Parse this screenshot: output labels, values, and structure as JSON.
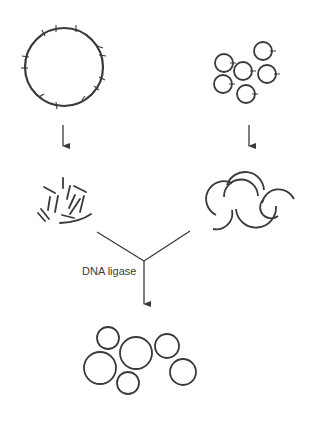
{
  "diagram": {
    "type": "process-flow",
    "stroke_color": "#3a3a3a",
    "labels": {
      "ligase_step": "DNA ligase"
    },
    "nodes": [
      {
        "id": "large-circular-dna",
        "shape": "circle-with-cut-sites",
        "count": 1
      },
      {
        "id": "small-plasmids",
        "shape": "small-circles-with-cut-site",
        "count": 6
      },
      {
        "id": "dna-fragments",
        "shape": "short-linear-fragments"
      },
      {
        "id": "opened-plasmids",
        "shape": "open-arcs",
        "count": 5
      },
      {
        "id": "recombinant-plasmids",
        "shape": "closed-circles",
        "count": 6
      }
    ],
    "edges": [
      {
        "from": "large-circular-dna",
        "to": "dna-fragments"
      },
      {
        "from": "small-plasmids",
        "to": "opened-plasmids"
      },
      {
        "from": "dna-fragments",
        "to": "recombinant-plasmids",
        "label": "DNA ligase"
      },
      {
        "from": "opened-plasmids",
        "to": "recombinant-plasmids",
        "label": "DNA ligase"
      }
    ]
  }
}
